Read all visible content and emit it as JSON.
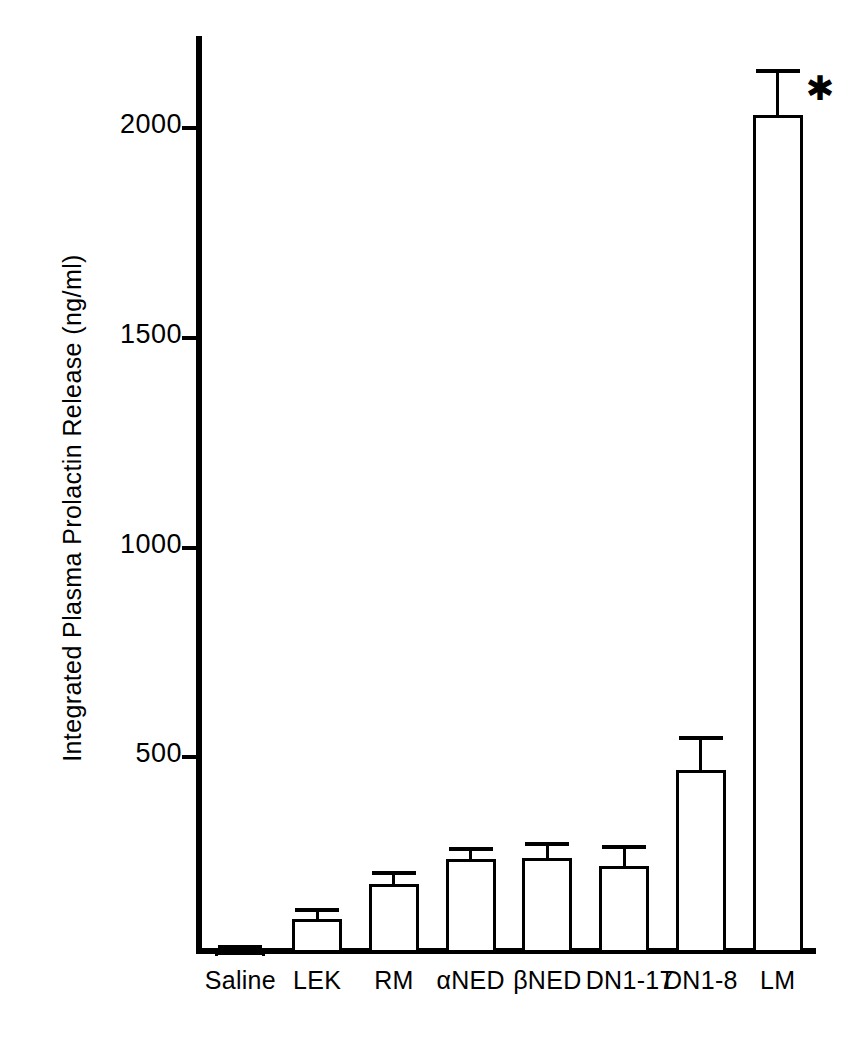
{
  "chart_data": {
    "type": "bar",
    "title": "",
    "xlabel": "",
    "ylabel": "Integrated Plasma Prolactin Release (ng/ml)",
    "categories": [
      "Saline",
      "LEK",
      "RM",
      "αNED",
      "βNED",
      "DN1-17",
      "DN1-8",
      "LM"
    ],
    "values": [
      34,
      113,
      198,
      256,
      259,
      240,
      470,
      2030
    ],
    "errors": [
      18,
      26,
      30,
      30,
      38,
      50,
      80,
      110
    ],
    "annotations": [
      {
        "category": "LM",
        "text": "*",
        "meaning": "significant"
      }
    ],
    "yticks": [
      500,
      1000,
      1500,
      2000
    ],
    "ytick_labels": [
      "500",
      "1000",
      "1500",
      "2000"
    ],
    "ylim": [
      0,
      2200
    ],
    "grid": false,
    "legend": false,
    "bar_fill": "#ffffff",
    "bar_edge": "#000000"
  },
  "axis": {
    "y_title": "Integrated Plasma Prolactin Release (ng/ml)",
    "tick_2000": "2000",
    "tick_1500": "1500",
    "tick_1000": "1000",
    "tick_500": "500"
  },
  "bars": [
    {
      "label": "Saline",
      "value": 34,
      "error": 18
    },
    {
      "label": "LEK",
      "value": 113,
      "error": 26
    },
    {
      "label": "RM",
      "value": 198,
      "error": 30
    },
    {
      "label": "αNED",
      "value": 256,
      "error": 30
    },
    {
      "label": "βNED",
      "value": 259,
      "error": 38
    },
    {
      "label": "DN1-17",
      "value": 240,
      "error": 50
    },
    {
      "label": "DN1-8",
      "value": 470,
      "error": 80
    },
    {
      "label": "LM",
      "value": 2030,
      "error": 110
    }
  ],
  "significance": {
    "marker": "✱"
  }
}
